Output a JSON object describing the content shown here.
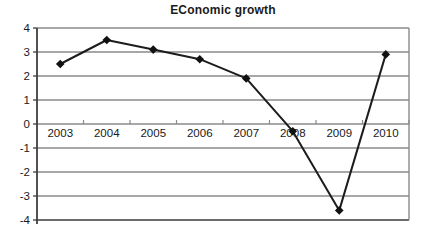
{
  "chart_data": {
    "type": "line",
    "title": "EConomic growth",
    "categories": [
      "2003",
      "2004",
      "2005",
      "2006",
      "2007",
      "2008",
      "2009",
      "2010"
    ],
    "values": [
      2.5,
      3.5,
      3.1,
      2.7,
      1.9,
      -0.3,
      -3.6,
      2.9
    ],
    "ylim": [
      -4,
      4
    ],
    "ytick_labels": [
      "4",
      "3",
      "2",
      "1",
      "0",
      "-1",
      "-2",
      "-3",
      "-4"
    ],
    "xlabel": "",
    "ylabel": "",
    "grid": "horizontal",
    "legend": "none",
    "marker": "diamond",
    "colors": {
      "line": "#1c1c1c",
      "marker": "#111111",
      "grid": "#8a8a8a",
      "axis": "#3f3f3f",
      "text": "#1a1a1a",
      "background": "#ffffff"
    }
  }
}
